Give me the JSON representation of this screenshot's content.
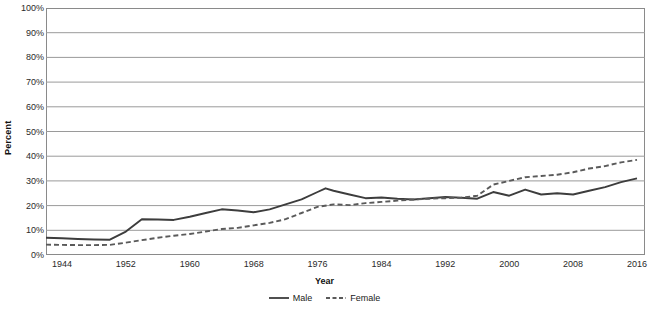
{
  "chart_data": {
    "type": "line",
    "title": "",
    "xlabel": "Year",
    "ylabel": "Percent",
    "xlim": [
      1942,
      2017
    ],
    "ylim": [
      0,
      100
    ],
    "grid": true,
    "legend_position": "bottom-center",
    "y_ticks": [
      "0%",
      "10%",
      "20%",
      "30%",
      "40%",
      "50%",
      "60%",
      "70%",
      "80%",
      "90%",
      "100%"
    ],
    "y_tick_values": [
      0,
      10,
      20,
      30,
      40,
      50,
      60,
      70,
      80,
      90,
      100
    ],
    "x_ticks": [
      "1944",
      "1952",
      "1960",
      "1968",
      "1976",
      "1984",
      "1992",
      "2000",
      "2008",
      "2016"
    ],
    "x_tick_values": [
      1944,
      1952,
      1960,
      1968,
      1976,
      1984,
      1992,
      2000,
      2008,
      2016
    ],
    "series": [
      {
        "name": "Male",
        "style": "solid",
        "color": "#3d3d3d",
        "x": [
          1942,
          1944,
          1946,
          1948,
          1950,
          1952,
          1954,
          1956,
          1958,
          1960,
          1962,
          1964,
          1966,
          1968,
          1970,
          1972,
          1974,
          1976,
          1977,
          1978,
          1980,
          1982,
          1984,
          1986,
          1988,
          1990,
          1992,
          1994,
          1996,
          1998,
          2000,
          2002,
          2004,
          2006,
          2008,
          2010,
          2012,
          2014,
          2016
        ],
        "values": [
          7.0,
          6.8,
          6.5,
          6.3,
          6.2,
          9.5,
          14.5,
          14.4,
          14.2,
          15.5,
          17.0,
          18.5,
          18.0,
          17.3,
          18.5,
          20.5,
          22.5,
          25.5,
          27.0,
          26.0,
          24.5,
          23.0,
          23.3,
          22.8,
          22.5,
          23.0,
          23.5,
          23.2,
          22.8,
          25.5,
          24.0,
          26.5,
          24.5,
          25.0,
          24.5,
          26.0,
          27.5,
          29.5,
          31.0
        ]
      },
      {
        "name": "Female",
        "style": "dashed",
        "color": "#5a5a5a",
        "x": [
          1942,
          1944,
          1946,
          1948,
          1950,
          1952,
          1954,
          1956,
          1958,
          1960,
          1962,
          1964,
          1966,
          1968,
          1970,
          1972,
          1974,
          1976,
          1978,
          1980,
          1982,
          1984,
          1986,
          1988,
          1990,
          1992,
          1994,
          1996,
          1998,
          2000,
          2002,
          2004,
          2006,
          2008,
          2010,
          2012,
          2014,
          2016
        ],
        "values": [
          4.2,
          4.1,
          4.0,
          4.0,
          4.1,
          5.0,
          6.0,
          7.0,
          7.8,
          8.5,
          9.5,
          10.5,
          11.0,
          12.0,
          13.0,
          14.5,
          17.0,
          19.5,
          20.5,
          20.2,
          21.0,
          21.5,
          22.0,
          22.5,
          22.8,
          23.0,
          23.2,
          24.0,
          28.5,
          30.0,
          31.5,
          32.0,
          32.5,
          33.5,
          35.0,
          36.0,
          37.5,
          38.5
        ]
      }
    ]
  },
  "axes": {
    "y_title": "Percent",
    "x_title": "Year"
  },
  "legend": {
    "items": [
      {
        "label": "Male",
        "style": "solid"
      },
      {
        "label": "Female",
        "style": "dashed"
      }
    ]
  },
  "colors": {
    "male_line": "#3d3d3d",
    "female_line": "#5a5a5a",
    "gridline": "#9a9a9a",
    "frame": "#8a8a8a",
    "text": "#1a1a1a"
  }
}
